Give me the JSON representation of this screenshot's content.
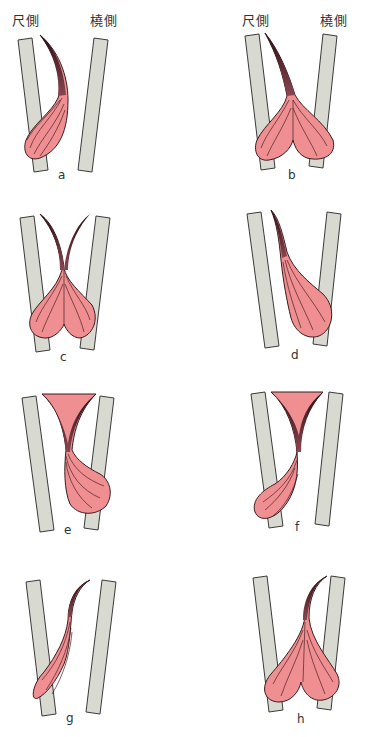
{
  "headers": {
    "left": {
      "ulnar": "尺側",
      "radial": "橈側"
    },
    "right": {
      "ulnar": "尺側",
      "radial": "橈側"
    }
  },
  "colors": {
    "bone_fill": "#d8d9d0",
    "bone_stroke": "#3a3a3a",
    "muscle_fill": "#ef8f92",
    "muscle_stroke": "#3b1a1c",
    "tendon_fill": "#7a3a44",
    "fiber": "#4a1f22"
  },
  "panels": [
    {
      "id": "a",
      "label": "a",
      "description": "single belly, tendon from center curving to ulnar side"
    },
    {
      "id": "b",
      "label": "b",
      "description": "double belly, single tendon from ulnar side"
    },
    {
      "id": "c",
      "label": "c",
      "description": "double belly, two tendons splitting"
    },
    {
      "id": "d",
      "label": "d",
      "description": "single belly on radial side, tendon from ulnar"
    },
    {
      "id": "e",
      "label": "e",
      "description": "single belly radial side, split tendons"
    },
    {
      "id": "f",
      "label": "f",
      "description": "single belly ulnar side, split tendons"
    },
    {
      "id": "g",
      "label": "g",
      "description": "single belly ulnar side, tendon curving to radial"
    },
    {
      "id": "h",
      "label": "h",
      "description": "double belly, single tendon curving to radial"
    }
  ]
}
